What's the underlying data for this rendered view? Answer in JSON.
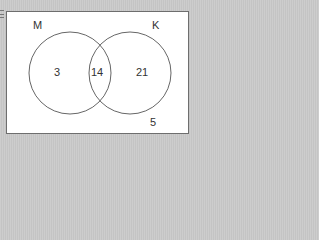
{
  "diagram": {
    "type": "venn",
    "sets": [
      {
        "label": "M",
        "only_count": "3"
      },
      {
        "label": "K",
        "only_count": "21"
      }
    ],
    "intersection_count": "14",
    "outside_count": "5",
    "colors": {
      "background": "#c9c9c9",
      "universe_fill": "#ffffff",
      "stroke": "#555555",
      "text": "#333333"
    }
  }
}
